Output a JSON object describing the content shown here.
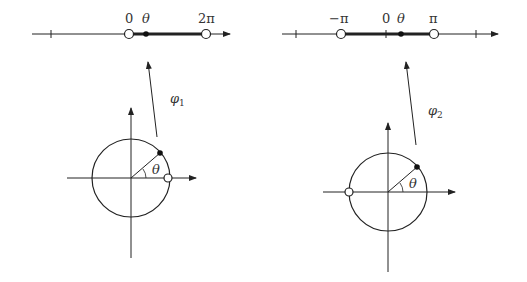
{
  "left_diagram": {
    "number_line": {
      "labels": {
        "zero": "0",
        "theta": "θ",
        "end": "2π"
      }
    },
    "map_label": {
      "base": "φ",
      "sub": "1"
    },
    "angle_label": "θ"
  },
  "right_diagram": {
    "number_line": {
      "labels": {
        "start": "−π",
        "zero": "0",
        "theta": "θ",
        "end": "π"
      }
    },
    "map_label": {
      "base": "φ",
      "sub": "2"
    },
    "angle_label": "θ"
  },
  "colors": {
    "stroke": "#222222",
    "label": "#333333",
    "background": "#ffffff"
  }
}
